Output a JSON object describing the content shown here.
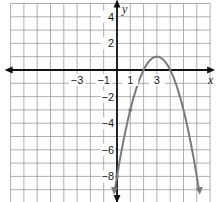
{
  "chart_data": {
    "type": "line",
    "title": "",
    "xlabel": "x",
    "ylabel": "y",
    "xlim": [
      -8,
      7
    ],
    "ylim": [
      -10,
      5
    ],
    "grid": true,
    "x_tick_labels": [
      "-3",
      "-1",
      "1",
      "3"
    ],
    "x_tick_values": [
      -3,
      -1,
      1,
      3
    ],
    "y_tick_labels": [
      "4",
      "2",
      "-2",
      "-4",
      "-6",
      "-8"
    ],
    "y_tick_values": [
      4,
      2,
      -2,
      -4,
      -6,
      -8
    ],
    "series": [
      {
        "name": "parabola",
        "equation": "y = -(x-3)^2 + 1",
        "color": "#7a7a7a",
        "vertex": [
          3,
          1
        ],
        "points": [
          [
            0,
            -8
          ],
          [
            1,
            -3
          ],
          [
            2,
            0
          ],
          [
            3,
            1
          ],
          [
            4,
            0
          ]
        ],
        "x": [
          -0.2,
          0,
          1,
          2,
          3,
          4,
          5,
          6.2
        ],
        "y": [
          -9.24,
          -8,
          -3,
          0,
          1,
          0,
          -3,
          -9.24
        ]
      }
    ],
    "legend": null
  },
  "labels": {
    "x_axis": "x",
    "y_axis": "y",
    "xticks": [
      "−3",
      "−1",
      "1",
      "3"
    ],
    "yticks": [
      "4",
      "2",
      "−2",
      "−4",
      "−6",
      "−8"
    ]
  },
  "colors": {
    "grid": "#9a9a9a",
    "axis": "#111111",
    "curve": "#7a7a7a"
  }
}
